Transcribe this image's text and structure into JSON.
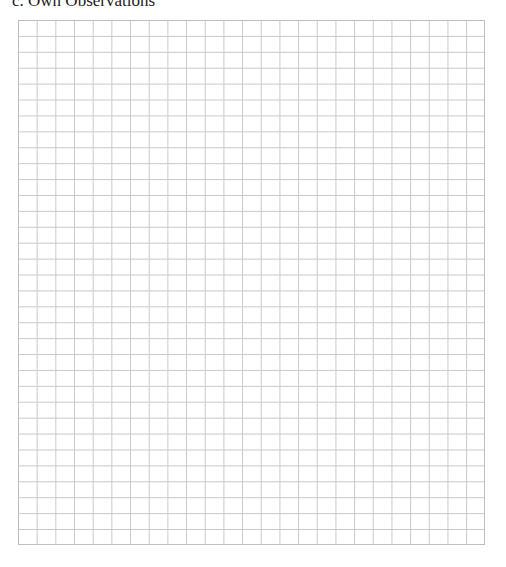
{
  "section": {
    "title": "c. Own Observations"
  },
  "grid": {
    "columns": 25,
    "rows": 33,
    "line_color": "#c9c9c9",
    "border_color": "#bdbdbd"
  }
}
